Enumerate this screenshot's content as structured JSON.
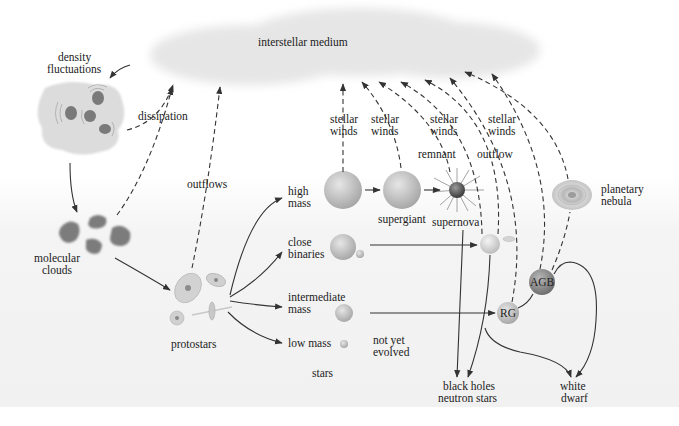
{
  "colors": {
    "background": "#ffffff",
    "cloud": "#e9e9e9",
    "band": "#f3f3f3",
    "star_fill": "#c8c8c8",
    "star_dark": "#8a8a8a",
    "clump": "#7d7d7d",
    "line": "#333333"
  },
  "labels": {
    "ism": "interstellar medium",
    "density1": "density",
    "density2": "fluctuations",
    "dissipation": "dissipation",
    "molecular1": "molecular",
    "molecular2": "clouds",
    "outflows": "outflows",
    "protostars": "protostars",
    "high1": "high",
    "high2": "mass",
    "close1": "close",
    "close2": "binaries",
    "inter1": "intermediate",
    "inter2": "mass",
    "low": "low mass",
    "stars": "stars",
    "notyet1": "not yet",
    "notyet2": "evolved",
    "supergiant": "supergiant",
    "supernova": "supernova",
    "remnant": "remnant",
    "outflow": "outflow",
    "sw_a1": "stellar",
    "sw_a2": "winds",
    "sw_b1": "stellar",
    "sw_b2": "winds",
    "sw_c1": "stellar",
    "sw_c2": "winds",
    "sw_d1": "stellar",
    "sw_d2": "winds",
    "planetary1": "planetary",
    "planetary2": "nebula",
    "rg": "RG",
    "agb": "AGB",
    "bh1": "black holes",
    "bh2": "neutron stars",
    "wd1": "white",
    "wd2": "dwarf"
  },
  "nodes": [
    {
      "id": "interstellar-medium",
      "label": "interstellar medium"
    },
    {
      "id": "density-fluctuations",
      "label": "density fluctuations"
    },
    {
      "id": "molecular-clouds",
      "label": "molecular clouds"
    },
    {
      "id": "protostars",
      "label": "protostars"
    },
    {
      "id": "high-mass",
      "label": "high mass"
    },
    {
      "id": "close-binaries",
      "label": "close binaries"
    },
    {
      "id": "intermediate-mass",
      "label": "intermediate mass"
    },
    {
      "id": "low-mass",
      "label": "low mass"
    },
    {
      "id": "supergiant",
      "label": "supergiant"
    },
    {
      "id": "supernova",
      "label": "supernova"
    },
    {
      "id": "binary-star",
      "label": ""
    },
    {
      "id": "rg",
      "label": "RG"
    },
    {
      "id": "agb",
      "label": "AGB"
    },
    {
      "id": "planetary-nebula",
      "label": "planetary nebula"
    },
    {
      "id": "black-holes-neutron-stars",
      "label": "black holes neutron stars"
    },
    {
      "id": "white-dwarf",
      "label": "white dwarf"
    }
  ],
  "edges": [
    {
      "from": "interstellar-medium",
      "to": "density-fluctuations",
      "style": "solid"
    },
    {
      "from": "density-fluctuations",
      "to": "interstellar-medium",
      "style": "dashed",
      "label": "dissipation"
    },
    {
      "from": "density-fluctuations",
      "to": "molecular-clouds",
      "style": "solid"
    },
    {
      "from": "molecular-clouds",
      "to": "protostars",
      "style": "solid"
    },
    {
      "from": "protostars",
      "to": "interstellar-medium",
      "style": "dashed",
      "label": "outflows"
    },
    {
      "from": "protostars",
      "to": "high-mass",
      "style": "solid"
    },
    {
      "from": "protostars",
      "to": "close-binaries",
      "style": "solid"
    },
    {
      "from": "protostars",
      "to": "intermediate-mass",
      "style": "solid"
    },
    {
      "from": "protostars",
      "to": "low-mass",
      "style": "solid"
    },
    {
      "from": "high-mass",
      "to": "supergiant",
      "style": "solid"
    },
    {
      "from": "supergiant",
      "to": "supernova",
      "style": "solid"
    },
    {
      "from": "high-mass",
      "to": "interstellar-medium",
      "style": "dashed",
      "label": "stellar winds"
    },
    {
      "from": "supergiant",
      "to": "interstellar-medium",
      "style": "dashed",
      "label": "stellar winds"
    },
    {
      "from": "supernova",
      "to": "interstellar-medium",
      "style": "dashed",
      "label": "remnant"
    },
    {
      "from": "binary-star",
      "to": "interstellar-medium",
      "style": "dashed",
      "label": "stellar winds"
    },
    {
      "from": "binary-star",
      "to": "interstellar-medium",
      "style": "dashed",
      "label": "outflow"
    },
    {
      "from": "rg",
      "to": "interstellar-medium",
      "style": "dashed",
      "label": "stellar winds"
    },
    {
      "from": "agb",
      "to": "interstellar-medium",
      "style": "dashed"
    },
    {
      "from": "planetary-nebula",
      "to": "interstellar-medium",
      "style": "dashed"
    },
    {
      "from": "close-binaries",
      "to": "binary-star",
      "style": "solid"
    },
    {
      "from": "intermediate-mass",
      "to": "rg",
      "style": "solid"
    },
    {
      "from": "rg",
      "to": "agb",
      "style": "solid"
    },
    {
      "from": "agb",
      "to": "planetary-nebula",
      "style": "dashed"
    },
    {
      "from": "agb",
      "to": "white-dwarf",
      "style": "solid"
    },
    {
      "from": "supernova",
      "to": "black-holes-neutron-stars",
      "style": "solid"
    },
    {
      "from": "binary-star",
      "to": "black-holes-neutron-stars",
      "style": "solid"
    },
    {
      "from": "binary-star",
      "to": "white-dwarf",
      "style": "solid"
    }
  ]
}
